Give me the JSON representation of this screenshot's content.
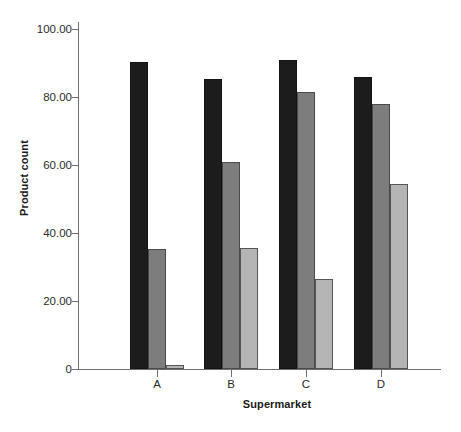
{
  "chart_data": {
    "type": "bar",
    "title": "",
    "xlabel": "Supermarket",
    "ylabel": "Product count",
    "categories": [
      "A",
      "B",
      "C",
      "D"
    ],
    "ylim": [
      0,
      100
    ],
    "ytick_values": [
      0,
      20,
      40,
      60,
      80,
      100
    ],
    "ytick_labels": [
      "0",
      "20.00",
      "40.00",
      "60.00",
      "80.00",
      "100.00"
    ],
    "grid": false,
    "legend": "none",
    "series": [
      {
        "name": "series-1",
        "color": "#1c1c1c",
        "values": [
          90.3,
          85.2,
          91.0,
          85.8
        ]
      },
      {
        "name": "series-2",
        "color": "#7d7d7d",
        "values": [
          35.3,
          60.8,
          81.4,
          77.8
        ]
      },
      {
        "name": "series-3",
        "color": "#b5b5b5",
        "values": [
          1.3,
          35.5,
          26.5,
          54.4
        ]
      }
    ]
  },
  "axes": {
    "y_axis_title": "Product count",
    "x_axis_title": "Supermarket"
  }
}
